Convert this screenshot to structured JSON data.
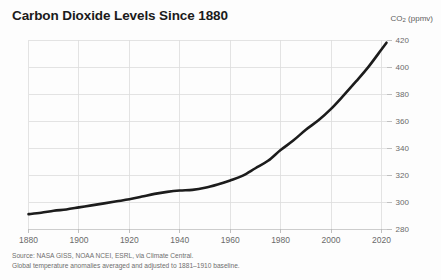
{
  "title": "Carbon Dioxide Levels Since 1880",
  "y_axis_title_main": "CO",
  "y_axis_title_sub": "2",
  "y_axis_title_unit": " (ppmv)",
  "source_line1": "Source: NASA GISS, NOAA NCEI, ESRL, via Climate Central.",
  "source_line2": "Global temperature anomalies averaged and adjusted to 1881–1910 baseline.",
  "colors": {
    "line": "#1c1c1c",
    "grid": "#dcdcdc",
    "text": "#231f20",
    "muted_text": "#6a6a6a",
    "background": "#fdfdfd"
  },
  "chart_data": {
    "type": "line",
    "title": "Carbon Dioxide Levels Since 1880",
    "xlabel": "",
    "ylabel": "CO2 (ppmv)",
    "xlim": [
      1880,
      2022
    ],
    "ylim": [
      280,
      420
    ],
    "grid": true,
    "legend": "none",
    "x_ticks": [
      1880,
      1900,
      1920,
      1940,
      1960,
      1980,
      2000,
      2020
    ],
    "y_ticks": [
      280,
      300,
      320,
      340,
      360,
      380,
      400,
      420
    ],
    "series": [
      {
        "name": "Atmospheric CO2 concentration",
        "x": [
          1880,
          1885,
          1890,
          1895,
          1900,
          1905,
          1910,
          1915,
          1920,
          1925,
          1930,
          1935,
          1940,
          1945,
          1950,
          1955,
          1960,
          1965,
          1970,
          1975,
          1980,
          1985,
          1990,
          1995,
          2000,
          2005,
          2010,
          2015,
          2020,
          2022
        ],
        "values": [
          291.0,
          292.0,
          293.5,
          294.5,
          296.0,
          297.5,
          299.0,
          300.5,
          302.0,
          304.0,
          306.0,
          307.5,
          308.5,
          309.0,
          310.5,
          313.0,
          316.0,
          319.5,
          325.0,
          330.5,
          338.5,
          345.5,
          353.5,
          360.5,
          369.0,
          379.0,
          389.5,
          400.5,
          413.0,
          418.0
        ]
      }
    ]
  }
}
